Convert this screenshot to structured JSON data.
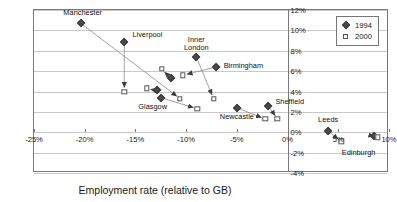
{
  "chart_data": {
    "type": "scatter",
    "title": "",
    "xlabel": "Employment rate (relative to GB)",
    "ylabel": "ILO unemployment rate (relative to GB)",
    "xlim": [
      -25,
      10
    ],
    "ylim": [
      -4,
      12
    ],
    "xticks": [
      "-25%",
      "-20%",
      "-15%",
      "-10%",
      "-5%",
      "0%",
      "5%",
      "10%"
    ],
    "xtick_values": [
      -25,
      -20,
      -15,
      -10,
      -5,
      0,
      5,
      10
    ],
    "yticks": [
      "12%",
      "10%",
      "8%",
      "6%",
      "4%",
      "2%",
      "0%",
      "-2%",
      "-4%"
    ],
    "ytick_values": [
      12,
      10,
      8,
      6,
      4,
      2,
      0,
      -2,
      -4
    ],
    "grid": true,
    "legend_position": "top-right",
    "series": [
      {
        "name": "1994",
        "marker": "diamond"
      },
      {
        "name": "2000",
        "marker": "square"
      }
    ],
    "annotation": "Arrows connect each city's 1994 position to its 2000 position",
    "points": [
      {
        "city": "Manchester",
        "x1994": -20.4,
        "y1994": 10.7,
        "x2000": -10.6,
        "y2000": 3.3,
        "label_x": -20.2,
        "label_y": 11.6,
        "label_align": "center"
      },
      {
        "city": "Liverpool",
        "x1994": -16.1,
        "y1994": 8.9,
        "x2000": -16.1,
        "y2000": 4.0,
        "label_x": -15.3,
        "label_y": 9.4,
        "label_align": "left"
      },
      {
        "city": "Inner London",
        "x1994": -9.0,
        "y1994": 7.4,
        "x2000": -7.3,
        "y2000": 3.3,
        "label_x": -9.0,
        "label_y": 9.0,
        "label_align": "center"
      },
      {
        "city": "Birmingham",
        "x1994": -7.1,
        "y1994": 6.4,
        "x2000": -10.3,
        "y2000": 5.6,
        "label_x": -6.3,
        "label_y": 6.4,
        "label_align": "left"
      },
      {
        "city": "Glasgow",
        "x1994": -12.5,
        "y1994": 3.4,
        "x2000": -8.9,
        "y2000": 2.3,
        "label_x": -13.3,
        "label_y": 2.4,
        "label_align": "center"
      },
      {
        "city": "Newcastle",
        "x1994": -5.0,
        "y1994": 2.4,
        "x2000": -2.2,
        "y2000": 1.3,
        "label_x": -5.0,
        "label_y": 1.4,
        "label_align": "center"
      },
      {
        "city": "Sheffield",
        "x1994": -1.9,
        "y1994": 2.6,
        "x2000": -1.0,
        "y2000": 1.3,
        "label_x": -1.2,
        "label_y": 2.9,
        "label_align": "left"
      },
      {
        "city": "Leeds",
        "x1994": 4.0,
        "y1994": 0.1,
        "x2000": 5.3,
        "y2000": -0.9,
        "label_x": 4.0,
        "label_y": 1.1,
        "label_align": "center"
      },
      {
        "city": "Edinburgh",
        "x1994": 8.5,
        "y1994": -0.4,
        "x2000": 8.9,
        "y2000": -0.5,
        "label_x": 7.0,
        "label_y": -2.1,
        "label_align": "center"
      },
      {
        "city": "unlabelled-a",
        "x1994": -11.5,
        "y1994": 5.3,
        "x2000": -12.4,
        "y2000": 6.2,
        "label_x": null,
        "label_y": null,
        "label_align": "center"
      },
      {
        "city": "unlabelled-b",
        "x1994": -12.9,
        "y1994": 4.1,
        "x2000": -13.9,
        "y2000": 4.3,
        "label_x": null,
        "label_y": null,
        "label_align": "center"
      }
    ]
  },
  "legend": {
    "entries": [
      {
        "label": "1994",
        "marker": "diamond-icon"
      },
      {
        "label": "2000",
        "marker": "square-icon"
      }
    ]
  }
}
